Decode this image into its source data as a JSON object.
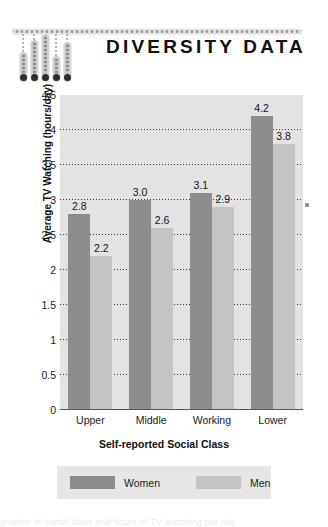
{
  "header": {
    "title": "DIVERSITY DATA",
    "decoration": {
      "name": "hanging-bar-graph-ornament",
      "bar_count": 5,
      "bar_lengths": [
        30,
        42,
        48,
        26,
        40
      ]
    }
  },
  "chart_data": {
    "type": "bar",
    "title": "DIVERSITY DATA",
    "xlabel": "Self-reported Social Class",
    "ylabel": "Average TV Watching (hours/day)",
    "categories": [
      "Upper",
      "Middle",
      "Working",
      "Lower"
    ],
    "series": [
      {
        "name": "Women",
        "color": "#8d8d8d",
        "values": [
          2.8,
          3.0,
          3.1,
          4.2
        ],
        "labels": [
          "2.8",
          "3.0",
          "3.1",
          "4.2"
        ]
      },
      {
        "name": "Men",
        "color": "#c4c4c4",
        "values": [
          2.2,
          2.6,
          2.9,
          3.8
        ],
        "labels": [
          "2.2",
          "2.6",
          "2.9",
          "3.8"
        ]
      }
    ],
    "ylim": [
      0,
      4.5
    ],
    "yticks": [
      0,
      0.5,
      1,
      1.5,
      2,
      2.5,
      3,
      3.5,
      4,
      4.5
    ],
    "ytick_labels": [
      "0",
      "0.5",
      "1",
      "1.5",
      "2",
      "2.5",
      "3",
      "3.5",
      "4",
      "4.5"
    ],
    "grid": true,
    "grid_style": "dotted-horizontal",
    "legend_position": "bottom",
    "plot_background": "#e3e3e3"
  },
  "legend": {
    "items": [
      {
        "label": "Women",
        "color": "#8d8d8d"
      },
      {
        "label": "Men",
        "color": "#c4c4c4"
      }
    ]
  },
  "colors": {
    "women": "#8d8d8d",
    "men": "#c4c4c4",
    "plot_bg": "#e3e3e3",
    "legend_bg": "#e6e6e6",
    "text": "#1a1a1a"
  },
  "footer": {
    "bleed_text": "graphic of social class and hours of TV watching per day"
  }
}
